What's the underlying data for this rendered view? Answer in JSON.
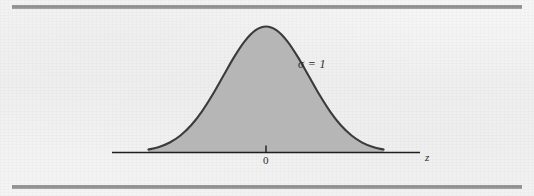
{
  "figure": {
    "caption_labels": {
      "sigma": "σ = 1",
      "axis": "z",
      "center_tick": "0"
    }
  },
  "chart_data": {
    "type": "line",
    "title": "",
    "subtitle": "",
    "xlabel": "z",
    "ylabel": "",
    "annotations": [
      {
        "text": "σ = 1",
        "x": 1.25,
        "y": 0.72
      }
    ],
    "tick_labels": {
      "x": [
        "0"
      ],
      "y": []
    },
    "x_tick_values": [
      0
    ],
    "xlim": [
      -3.6,
      3.6
    ],
    "ylim": [
      0,
      1.08
    ],
    "grid": false,
    "legend": null,
    "distribution": {
      "name": "standard normal",
      "mean": 0,
      "sigma": 1,
      "curve_truncated_at": [
        -2.75,
        2.75
      ],
      "shaded": true
    },
    "x": [
      -2.75,
      -2.5,
      -2.25,
      -2.0,
      -1.75,
      -1.5,
      -1.25,
      -1.0,
      -0.75,
      -0.5,
      -0.25,
      0,
      0.25,
      0.5,
      0.75,
      1.0,
      1.25,
      1.5,
      1.75,
      2.0,
      2.25,
      2.5,
      2.75
    ],
    "values": [
      0.023,
      0.044,
      0.079,
      0.135,
      0.216,
      0.325,
      0.458,
      0.607,
      0.755,
      0.882,
      0.969,
      1.0,
      0.969,
      0.882,
      0.755,
      0.607,
      0.458,
      0.325,
      0.216,
      0.135,
      0.079,
      0.044,
      0.023
    ]
  },
  "colors": {
    "curve_fill": "#b4b4b4",
    "curve_stroke": "#3b3b3b",
    "axis": "#1e1e1e",
    "rule_bar": "#929292",
    "page_background": "#f3f3f3",
    "text": "#2b2b2b"
  },
  "icons": {
    "rule_top": "horizontal-rule",
    "rule_bottom": "horizontal-rule"
  }
}
